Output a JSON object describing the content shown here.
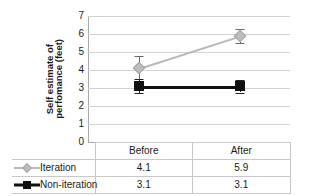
{
  "chart_data": {
    "type": "line",
    "title": "",
    "subtitle": "",
    "xlabel": "",
    "ylabel_line1": "Self estimate of",
    "ylabel_line2": "perfomance (feet)",
    "categories": [
      "Before",
      "After"
    ],
    "ylim": [
      0,
      7
    ],
    "yticks": [
      7,
      6,
      5,
      4,
      3,
      2,
      1,
      0
    ],
    "grid": true,
    "legend_position": "table-left-column",
    "series": [
      {
        "name": "Iteration",
        "values": [
          4.1,
          5.9
        ],
        "value_labels": [
          "4.1",
          "5.9"
        ],
        "color": "#b8b8b8",
        "marker": "diamond",
        "error_low": [
          3.4,
          5.5
        ],
        "error_high": [
          4.8,
          6.3
        ]
      },
      {
        "name": "Non-iteration",
        "values": [
          3.1,
          3.1
        ],
        "value_labels": [
          "3.1",
          "3.1"
        ],
        "color": "#111111",
        "marker": "square",
        "error_low": [
          2.7,
          2.75
        ],
        "error_high": [
          3.5,
          3.45
        ]
      }
    ]
  },
  "data_table": {
    "corner_label": "",
    "column_headers": [
      "Before",
      "After"
    ],
    "rows": [
      {
        "label": "Iteration",
        "cells": [
          "4.1",
          "5.9"
        ]
      },
      {
        "label": "Non-iteration",
        "cells": [
          "3.1",
          "3.1"
        ]
      }
    ]
  },
  "colors": {
    "iteration": "#b8b8b8",
    "noniteration": "#111111",
    "gridline": "#d2d2d2",
    "axis": "#a8a8a8",
    "table_border": "#c8c8c8",
    "text": "#1a1a1a",
    "background": "#ffffff"
  }
}
